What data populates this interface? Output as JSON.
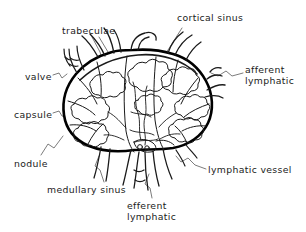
{
  "figure": {
    "style": "hand-drawn ink line art",
    "background_color": "#ffffff",
    "ink_color": "#1a1a1a",
    "leader_line_color": "#555555",
    "capsule_color": "#000000"
  },
  "labels": {
    "trabeculae": "trabeculae",
    "cortical_sinus": "cortical sinus",
    "afferent_lymphatic_line1": "afferent",
    "afferent_lymphatic_line2": "lymphatic",
    "valve": "valve",
    "capsule": "capsule",
    "nodule": "nodule",
    "medullary_sinus": "medullary sinus",
    "efferent_lymphatic_line1": "efferent",
    "efferent_lymphatic_line2": "lymphatic",
    "lymphatic_vessel": "lymphatic vessel"
  }
}
